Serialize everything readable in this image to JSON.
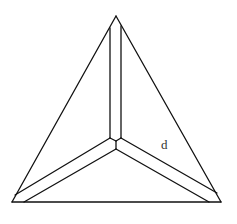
{
  "diagram": {
    "type": "geometric-figure",
    "stroke_color": "#111111",
    "background_color": "#ffffff",
    "labels": [
      {
        "id": "d",
        "text": "d",
        "x": 161,
        "y": 149
      }
    ],
    "vertices": {
      "apex": [
        116,
        16
      ],
      "bottom_left": [
        12,
        202
      ],
      "bottom_right": [
        221,
        202
      ],
      "center": [
        116,
        149
      ]
    }
  }
}
